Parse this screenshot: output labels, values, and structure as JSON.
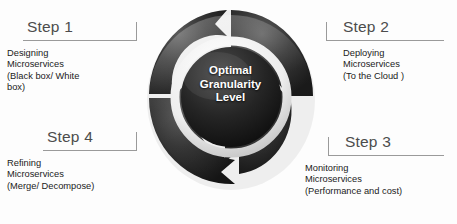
{
  "diagram": {
    "center": {
      "line1": "Optimal",
      "line2": "Granularity",
      "line3": "Level"
    },
    "colors": {
      "ring_dark": "#2b2b2b",
      "ring_inner_white": "#f2f2f2",
      "center_dark": "#232323",
      "center_text": "#ffffff",
      "connector_line": "#9a9a9a",
      "title_text": "#4c4c4c",
      "body_text": "#1b1b1b",
      "background": "#fdfdfd"
    },
    "steps": [
      {
        "id": "step-1",
        "title": "Step 1",
        "lines": [
          "Designing",
          "Microservices",
          "(Black box/ White",
          "box)"
        ]
      },
      {
        "id": "step-2",
        "title": "Step 2",
        "lines": [
          "Deploying",
          "Microservices",
          "(To the Cloud )"
        ]
      },
      {
        "id": "step-3",
        "title": "Step 3",
        "lines": [
          "Monitoring",
          "Microservices",
          "(Performance and cost)"
        ]
      },
      {
        "id": "step-4",
        "title": "Step 4",
        "lines": [
          "Refining",
          "Microservices",
          "(Merge/ Decompose)"
        ]
      }
    ]
  }
}
